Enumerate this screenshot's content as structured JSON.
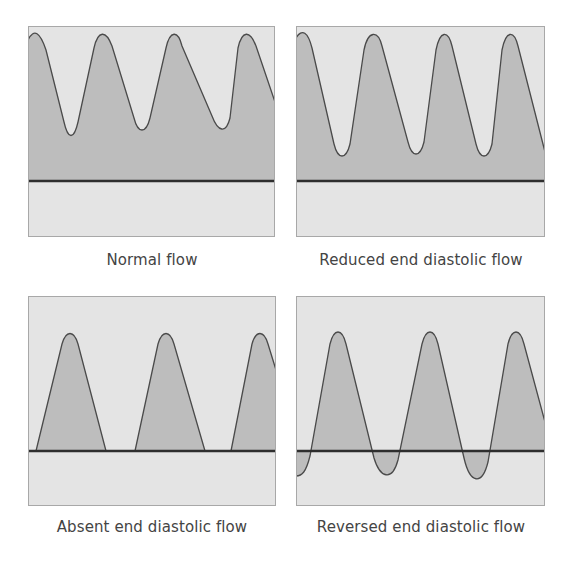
{
  "colors": {
    "background": "#e4e4e4",
    "fill": "#bdbdbd",
    "curve": "#4a4a4a",
    "baseline": "#2e2e2e",
    "border": "#a8a8a8"
  },
  "panels": [
    {
      "label": "Normal flow",
      "box": [
        28,
        26,
        247,
        211
      ],
      "baseline_y": 155,
      "path": "M0,14 C6,2 12,6 18,24 L36,96 C40,114 46,114 50,96 L66,22 C70,4 78,4 84,20 L106,92 C110,108 118,108 122,92 L138,22 C142,4 150,4 154,20 L184,90 C190,106 198,108 202,92 L210,22 C214,4 222,4 228,20 L247,76"
    },
    {
      "label": "Reduced end diastolic flow",
      "box": [
        296,
        26,
        249,
        211
      ],
      "baseline_y": 155,
      "path": "M0,12 C6,2 12,6 16,22 L38,118 C42,134 50,134 54,118 L68,24 C72,4 82,4 86,20 L112,116 C116,132 124,132 128,116 L140,24 C144,4 152,4 156,20 L180,118 C184,134 192,134 196,118 L206,24 C210,4 218,4 222,20 L249,126"
    },
    {
      "label": "Absent end diastolic flow",
      "box": [
        28,
        296,
        248,
        210
      ],
      "baseline_y": 155,
      "path": "M8,155 L34,48 C38,34 46,34 50,48 L78,155 M107,155 L130,48 C134,34 142,34 146,48 L177,155 M203,155 L224,48 C228,34 236,34 240,48 L248,74"
    },
    {
      "label": "Reversed end diastolic flow",
      "box": [
        296,
        296,
        249,
        210
      ],
      "baseline_y": 155,
      "path": "M0,180 C6,180 10,176 14,160 L34,48 C38,32 46,32 50,48 L78,162 C84,182 96,186 102,164 L126,48 C130,32 138,32 142,48 L168,162 C174,188 186,190 192,166 L212,48 C216,32 224,32 228,48 L249,126"
    }
  ],
  "captions_y": [
    251,
    251,
    518,
    518
  ],
  "captions_x": [
    22,
    291,
    22,
    291
  ]
}
